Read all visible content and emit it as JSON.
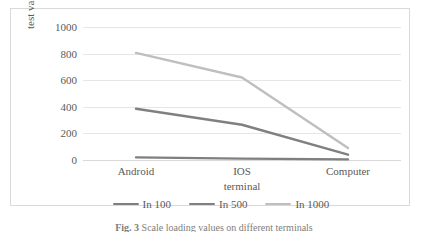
{
  "chart_data": {
    "type": "line",
    "title": "",
    "xlabel": "terminal",
    "ylabel": "test value",
    "categories": [
      "Android",
      "IOS",
      "Computer"
    ],
    "ylim": [
      0,
      1000
    ],
    "yticks": [
      0,
      200,
      400,
      600,
      800,
      1000
    ],
    "ytick_labels": [
      "0",
      "200",
      "400",
      "600",
      "800",
      "1000"
    ],
    "grid": true,
    "legend_position": "bottom",
    "series": [
      {
        "name": "In 100",
        "values": [
          20,
          10,
          5
        ],
        "color": "#7f7f7f"
      },
      {
        "name": "In 500",
        "values": [
          385,
          265,
          40
        ],
        "color": "#808080"
      },
      {
        "name": "In 1000",
        "values": [
          805,
          620,
          90
        ],
        "color": "#bfbfbf"
      }
    ]
  },
  "caption": {
    "label": "Fig. 3",
    "text": "Scale loading values on different terminals"
  },
  "colors": {
    "gridline": "#e6e6e6",
    "frame": "#d9d9d9",
    "text": "#5a5a5a"
  }
}
